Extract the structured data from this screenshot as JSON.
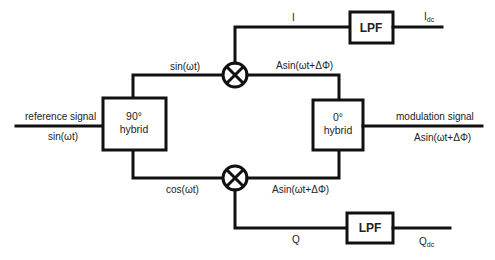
{
  "diagram": {
    "type": "IQ demodulator block diagram",
    "inputs": {
      "reference": {
        "label": "reference signal",
        "expr": "sin(ωt)"
      },
      "modulation": {
        "label": "modulation signal",
        "expr": "Asin(ωt+ΔΦ)"
      }
    },
    "blocks": {
      "hybrid90": {
        "line1": "90°",
        "line2": "hybrid"
      },
      "hybrid0": {
        "line1": "0°",
        "line2": "hybrid"
      },
      "lpf_top": {
        "label": "LPF"
      },
      "lpf_bottom": {
        "label": "LPF"
      }
    },
    "edges": {
      "top_lo": "sin(ωt)",
      "bottom_lo": "cos(ωt)",
      "top_rf": "Asin(ωt+ΔΦ)",
      "bottom_rf": "Asin(ωt+ΔΦ)",
      "i_branch": "I",
      "q_branch": "Q"
    },
    "outputs": {
      "i_dc": {
        "main": "I",
        "sub": "dc"
      },
      "q_dc": {
        "main": "Q",
        "sub": "dc"
      }
    }
  }
}
